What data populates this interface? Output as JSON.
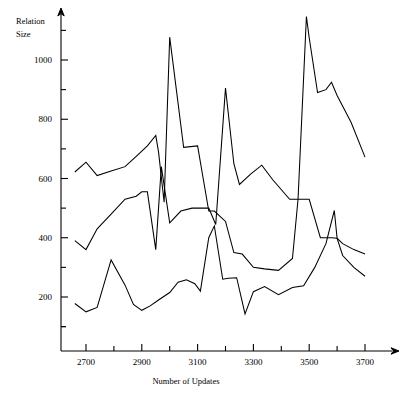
{
  "chart_data": {
    "type": "line",
    "title": "",
    "subtitle": "",
    "xlabel": "Number of Updates",
    "ylabel": "Relation Size",
    "ylabel_line1": "Relation",
    "ylabel_line2": "Size",
    "xlim": [
      2650,
      3760
    ],
    "ylim": [
      0,
      1150
    ],
    "xticks": [
      2700,
      2800,
      2900,
      3000,
      3100,
      3200,
      3300,
      3400,
      3500,
      3600,
      3700
    ],
    "xticklabels": [
      "2700",
      "",
      "2900",
      "",
      "3100",
      "",
      "3300",
      "",
      "3500",
      "",
      "3700"
    ],
    "xticklabels_shown": [
      "2700",
      "2900",
      "3100",
      "3300",
      "3500",
      "3700"
    ],
    "yticks": [
      100,
      200,
      300,
      400,
      500,
      600,
      700,
      800,
      900,
      1000,
      1100
    ],
    "yticklabels": [
      "",
      "200",
      "",
      "400",
      "",
      "600",
      "",
      "800",
      "",
      "1000",
      ""
    ],
    "yticklabels_shown": [
      "200",
      "400",
      "600",
      "800",
      "1000"
    ],
    "grid": false,
    "legend": null,
    "legend_position": "none",
    "line_color": "#000000",
    "background_color": "#ffffff",
    "series": [
      {
        "name": "upper-series",
        "x": [
          2660,
          2700,
          2740,
          2790,
          2840,
          2880,
          2920,
          2950,
          2960,
          2980,
          3000,
          3050,
          3100,
          3140,
          3160,
          3200,
          3230,
          3260,
          3300,
          3340,
          3390,
          3440,
          3460,
          3490,
          3500,
          3530,
          3560,
          3580,
          3600,
          3650,
          3700
        ],
        "values": [
          622,
          655,
          610,
          625,
          640,
          675,
          710,
          745,
          690,
          520,
          1077,
          705,
          710,
          490,
          490,
          455,
          350,
          345,
          300,
          295,
          290,
          330,
          530,
          1147,
          1075,
          890,
          900,
          925,
          880,
          790,
          672
        ]
      },
      {
        "name": "middle-series",
        "x": [
          2660,
          2700,
          2740,
          2790,
          2840,
          2880,
          2900,
          2920,
          2950,
          2970,
          3000,
          3040,
          3080,
          3100,
          3140,
          3165,
          3200,
          3230,
          3250,
          3290,
          3330,
          3370,
          3430,
          3470,
          3500,
          3540,
          3580,
          3600,
          3620,
          3660,
          3700
        ],
        "values": [
          390,
          360,
          430,
          480,
          530,
          540,
          555,
          555,
          360,
          640,
          450,
          490,
          500,
          500,
          500,
          445,
          905,
          650,
          580,
          615,
          645,
          595,
          530,
          530,
          530,
          400,
          400,
          398,
          380,
          360,
          345
        ]
      },
      {
        "name": "lower-series",
        "x": [
          2660,
          2700,
          2740,
          2790,
          2840,
          2870,
          2900,
          2930,
          2960,
          3000,
          3030,
          3060,
          3090,
          3110,
          3140,
          3160,
          3190,
          3210,
          3240,
          3270,
          3300,
          3340,
          3390,
          3440,
          3480,
          3520,
          3560,
          3590,
          3600,
          3620,
          3660,
          3700
        ],
        "values": [
          178,
          150,
          165,
          325,
          240,
          175,
          155,
          170,
          190,
          215,
          250,
          258,
          245,
          220,
          400,
          440,
          260,
          263,
          265,
          143,
          218,
          235,
          208,
          232,
          238,
          300,
          380,
          492,
          398,
          340,
          300,
          270
        ]
      }
    ],
    "annotations": []
  }
}
